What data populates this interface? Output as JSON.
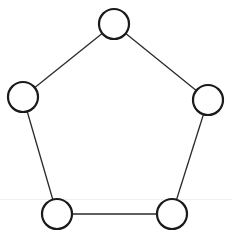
{
  "diagram": {
    "type": "graph",
    "shape": "pentagon-cycle",
    "colors": {
      "stroke": "#1a1a1a",
      "fill": "#ffffff",
      "edge": "#2a2a2a"
    },
    "node_radius": 15,
    "nodes": [
      {
        "id": "top",
        "x": 114,
        "y": 24
      },
      {
        "id": "left",
        "x": 23,
        "y": 97
      },
      {
        "id": "right",
        "x": 208,
        "y": 100
      },
      {
        "id": "bottom-left",
        "x": 57,
        "y": 214
      },
      {
        "id": "bottom-right",
        "x": 172,
        "y": 214
      }
    ],
    "edges": [
      [
        "top",
        "left"
      ],
      [
        "top",
        "right"
      ],
      [
        "left",
        "bottom-left"
      ],
      [
        "right",
        "bottom-right"
      ],
      [
        "bottom-left",
        "bottom-right"
      ]
    ]
  }
}
